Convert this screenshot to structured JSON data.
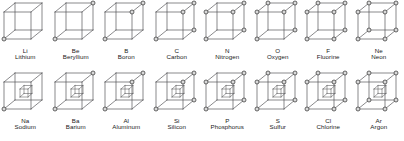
{
  "figure": {
    "background_color": "#ffffff",
    "line_color": "#58585a",
    "node_fill_color": "#d9d9d9",
    "node_stroke_color": "#3a3a3a",
    "text_color": "#1a1a1a",
    "columns": 8,
    "rows": 2
  },
  "geometry": {
    "cube_front": {
      "x": 4.0,
      "y": 12.0,
      "w": 27.0,
      "h": 27.0
    },
    "cube_depth_dx": 11.0,
    "cube_depth_dy": -9.0,
    "node_radius": 2.0,
    "inner_cube": {
      "x": 20.0,
      "y": 19.0,
      "w": 8.0,
      "h": 8.0,
      "dx": 4.0,
      "dy": -3.5
    }
  },
  "vertex_keys": [
    "bfl",
    "bfr",
    "tfl",
    "tfr",
    "bbl",
    "bbr",
    "tbl",
    "tbr"
  ],
  "chart_data": {
    "type": "diagram",
    "series": [
      {
        "name": "Period 2 (row 1)",
        "elements": [
          {
            "symbol": "Li",
            "name": "Lithium",
            "electrons": 1,
            "nodes": [
              "bfl"
            ]
          },
          {
            "symbol": "Be",
            "name": "Beryllium",
            "electrons": 2,
            "nodes": [
              "bfl",
              "tbr"
            ]
          },
          {
            "symbol": "B",
            "name": "Boron",
            "electrons": 3,
            "nodes": [
              "bfl",
              "tbr",
              "tfr"
            ]
          },
          {
            "symbol": "C",
            "name": "Carbon",
            "electrons": 4,
            "nodes": [
              "bfl",
              "tbr",
              "tfr",
              "bbr"
            ]
          },
          {
            "symbol": "N",
            "name": "Nitrogen",
            "electrons": 5,
            "nodes": [
              "bfl",
              "tbr",
              "tfr",
              "bbr",
              "tfl"
            ]
          },
          {
            "symbol": "O",
            "name": "Oxygen",
            "electrons": 6,
            "nodes": [
              "bfl",
              "tbr",
              "tfr",
              "bbr",
              "tfl",
              "tbl"
            ]
          },
          {
            "symbol": "F",
            "name": "Fluorine",
            "electrons": 7,
            "nodes": [
              "bfl",
              "tbr",
              "tfr",
              "bbr",
              "tfl",
              "tbl",
              "bfr"
            ]
          },
          {
            "symbol": "Ne",
            "name": "Neon",
            "electrons": 8,
            "nodes": [
              "bfl",
              "tbr",
              "tfr",
              "bbr",
              "tfl",
              "tbl",
              "bfr",
              "bbl"
            ]
          }
        ]
      },
      {
        "name": "Period 3 (row 2)",
        "elements": [
          {
            "symbol": "Na",
            "name": "Sodium",
            "electrons": 1,
            "nodes": [
              "bfl"
            ],
            "inner_cube": true
          },
          {
            "symbol": "Ba",
            "name": "Barium",
            "electrons": 2,
            "nodes": [
              "bfl",
              "tbr"
            ],
            "inner_cube": true
          },
          {
            "symbol": "Al",
            "name": "Aluminum",
            "electrons": 3,
            "nodes": [
              "bfl",
              "tbr",
              "tfr"
            ],
            "inner_cube": true
          },
          {
            "symbol": "Si",
            "name": "Silicon",
            "electrons": 4,
            "nodes": [
              "bfl",
              "tbr",
              "tfr",
              "bbr"
            ],
            "inner_cube": true
          },
          {
            "symbol": "P",
            "name": "Phosphorus",
            "electrons": 5,
            "nodes": [
              "bfl",
              "tbr",
              "tfr",
              "bbr",
              "tfl"
            ],
            "inner_cube": true
          },
          {
            "symbol": "S",
            "name": "Sulfur",
            "electrons": 6,
            "nodes": [
              "bfl",
              "tbr",
              "tfr",
              "bbr",
              "tfl",
              "tbl"
            ],
            "inner_cube": true
          },
          {
            "symbol": "Cl",
            "name": "Chlorine",
            "electrons": 7,
            "nodes": [
              "bfl",
              "tbr",
              "tfr",
              "bbr",
              "tfl",
              "tbl",
              "bfr"
            ],
            "inner_cube": true
          },
          {
            "symbol": "Ar",
            "name": "Argon",
            "electrons": 8,
            "nodes": [
              "bfl",
              "tbr",
              "tfr",
              "bbr",
              "tfl",
              "tbl",
              "bfr",
              "bbl"
            ],
            "inner_cube": true
          }
        ]
      }
    ]
  }
}
